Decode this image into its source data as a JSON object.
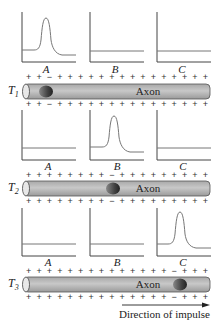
{
  "figure": {
    "axon_label": "Axon",
    "direction_label": "Direction of impulse",
    "graph_labels": [
      "A",
      "B",
      "C"
    ],
    "colors": {
      "axon_fill": "#bdbdbd",
      "axon_stroke": "#555555",
      "curve": "#777777",
      "axis": "#444444"
    },
    "rows": [
      {
        "time_label": "T",
        "time_sub": "1",
        "spike_at": "A",
        "top_signs": "+ + − + + + + + + + + + + + + + + +",
        "bottom_signs": "+ + − + + + + + + + + + + + + + + +"
      },
      {
        "time_label": "T",
        "time_sub": "2",
        "spike_at": "B",
        "top_signs": "+ + + + + + + + − + + + + + + + + +",
        "bottom_signs": "+ + + + + + + + − + + + + + + + + +"
      },
      {
        "time_label": "T",
        "time_sub": "3",
        "spike_at": "C",
        "top_signs": "+ + + + + + + + + + + + + + − + + +",
        "bottom_signs": "+ + + + + + + + + + + + + + − + + +"
      }
    ]
  }
}
